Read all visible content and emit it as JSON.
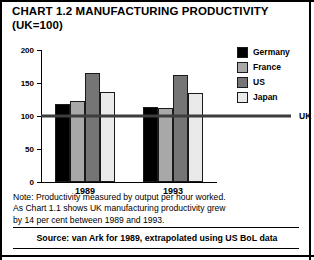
{
  "title": {
    "line1": "CHART 1.2 MANUFACTURING PRODUCTIVITY",
    "line2": "(UK=100)"
  },
  "legend": {
    "items": [
      {
        "label": "Germany",
        "color": "#000000"
      },
      {
        "label": "France",
        "color": "#a8a8a8"
      },
      {
        "label": "US",
        "color": "#757575"
      },
      {
        "label": "Japan",
        "color": "#eaeaea"
      }
    ]
  },
  "reference": {
    "label": "UK = 100",
    "value": 100,
    "color": "#3d3d3d"
  },
  "note": {
    "line1": "Note: Productivity measured by output per hour worked.",
    "line2": "As Chart 1.1 shows UK manufacturing productivity grew",
    "line3": "by 14 per cent between 1989 and 1993."
  },
  "source": "Source: van Ark for 1989, extrapolated using US BoL data",
  "chart_data": {
    "type": "bar",
    "title": "CHART 1.2 MANUFACTURING PRODUCTIVITY (UK=100)",
    "xlabel": "",
    "ylabel": "",
    "ylim": [
      0,
      200
    ],
    "yticks": [
      0,
      50,
      100,
      150,
      200
    ],
    "ytick_labels": [
      "0",
      "50",
      "100",
      "150",
      "200"
    ],
    "grid": false,
    "legend_position": "top-right",
    "categories": [
      "1989",
      "1993"
    ],
    "series": [
      {
        "name": "Germany",
        "color": "#000000",
        "values": [
          118,
          113
        ]
      },
      {
        "name": "France",
        "color": "#a8a8a8",
        "values": [
          123,
          112
        ]
      },
      {
        "name": "US",
        "color": "#757575",
        "values": [
          165,
          162
        ]
      },
      {
        "name": "Japan",
        "color": "#eaeaea",
        "values": [
          137,
          135
        ]
      }
    ],
    "reference_line": {
      "label": "UK = 100",
      "value": 100
    }
  }
}
